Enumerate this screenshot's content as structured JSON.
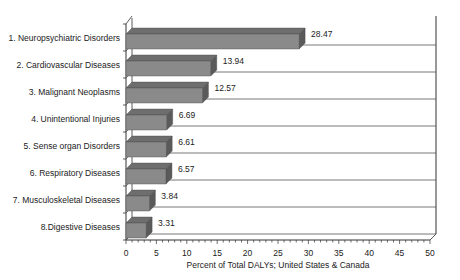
{
  "chart_data": {
    "type": "bar",
    "orientation": "horizontal",
    "style": "3d",
    "title": "",
    "xlabel": "Percent of Total DALYs; United States & Canada",
    "ylabel": "",
    "xlim": [
      0,
      50
    ],
    "xticks": [
      0,
      5,
      10,
      15,
      20,
      25,
      30,
      35,
      40,
      45,
      50
    ],
    "minor_tick_step": 1,
    "grid": true,
    "legend": null,
    "categories": [
      "1. Neuropsychiatric Disorders",
      "2. Cardiovascular Diseases",
      "3. Malignant Neoplasms",
      "4. Unintentional Injuries",
      "5. Sense organ Disorders",
      "6. Respiratory Diseases",
      "7. Musculoskeletal Diseases",
      "8.Digestive Diseases"
    ],
    "values": [
      28.47,
      13.94,
      12.57,
      6.69,
      6.61,
      6.57,
      3.84,
      3.31
    ],
    "value_labels": [
      "28.47",
      "13.94",
      "12.57",
      "6.69",
      "6.61",
      "6.57",
      "3.84",
      "3.31"
    ],
    "colors": {
      "bar_front": "#8a8a8a",
      "bar_top": "#6e6e6e",
      "bar_side": "#5a5a5a",
      "grid": "#555555",
      "axis": "#333333"
    }
  }
}
